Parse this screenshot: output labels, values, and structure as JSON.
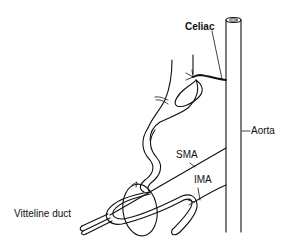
{
  "figure": {
    "type": "anatomical-diagram",
    "colors": {
      "ink": "#111111",
      "background": "#ffffff"
    },
    "labels": {
      "celiac": "Celiac",
      "aorta": "Aorta",
      "sma": "SMA",
      "ima": "IMA",
      "vitelline_duct": "Vitteline duct"
    }
  }
}
